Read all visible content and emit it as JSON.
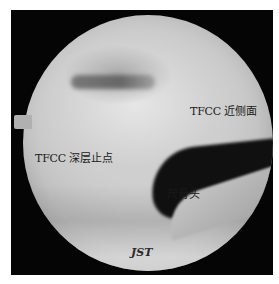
{
  "image": {
    "type": "arthroscopic view",
    "labels": {
      "tfcc_proximal_surface": "TFCC 近侧面",
      "tfcc_deep_insertion": "TFCC 深层止点",
      "ulnar_head": "尺骨头"
    },
    "logo": "JST"
  },
  "colors": {
    "frame": "#050505",
    "scope_light": "#e6e6e6",
    "scope_dark": "#4a4a4a",
    "label_text": "#1a1a1a"
  }
}
